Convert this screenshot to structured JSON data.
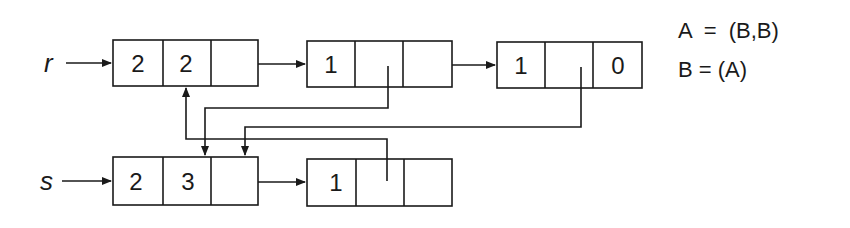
{
  "diagram": {
    "pointers": [
      {
        "label": "r",
        "target": "r-node-1"
      },
      {
        "label": "s",
        "target": "s-node-1"
      }
    ],
    "rows": {
      "r": [
        {
          "id": "r-node-1",
          "cells": [
            "2",
            "2",
            ""
          ]
        },
        {
          "id": "r-node-2",
          "cells": [
            "1",
            "",
            ""
          ]
        },
        {
          "id": "r-node-3",
          "cells": [
            "1",
            "",
            "0"
          ]
        }
      ],
      "s": [
        {
          "id": "s-node-1",
          "cells": [
            "2",
            "3",
            ""
          ]
        },
        {
          "id": "s-node-2",
          "cells": [
            "1",
            "",
            ""
          ]
        }
      ]
    },
    "links": [
      {
        "from": "r-node-1.cell3",
        "to": "r-node-2"
      },
      {
        "from": "r-node-2.cell3",
        "to": "r-node-3"
      },
      {
        "from": "s-node-1.cell3",
        "to": "s-node-2"
      },
      {
        "from": "r-node-2.cell2",
        "to": "s-node-1"
      },
      {
        "from": "r-node-3.cell2",
        "to": "s-node-1"
      },
      {
        "from": "s-node-2.cell2",
        "to": "r-node-1"
      }
    ],
    "legend": [
      {
        "text": "A  =  (B,B)"
      },
      {
        "text": "B = (A)"
      }
    ]
  }
}
